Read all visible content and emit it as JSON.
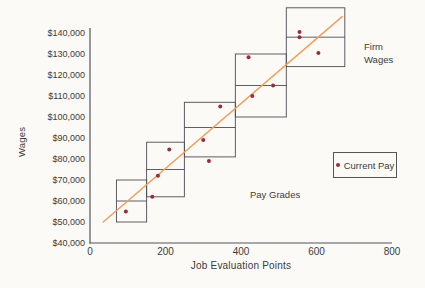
{
  "figure": {
    "y_axis_title": "Wages",
    "x_axis_title": "Job Evaluation Points",
    "annotation_firm_wages": "Firm Wages",
    "annotation_pay_grades": "Pay Grades",
    "legend_label": "Current Pay"
  },
  "colors": {
    "background": "#fbfaf6",
    "axis": "#55555a",
    "grade_box_border": "#4c4c55",
    "trend_line": "#efa05c",
    "data_point": "#992c3a",
    "text": "#3b3b3b"
  },
  "chart_data": {
    "type": "scatter",
    "title": "",
    "xlabel": "Job Evaluation Points",
    "ylabel": "Wages",
    "xlim": [
      0,
      800
    ],
    "ylim": [
      40000,
      140000
    ],
    "grid": false,
    "legend_position": "right-middle",
    "x_tick_values": [
      0,
      200,
      400,
      600,
      800
    ],
    "x_tick_labels": [
      "0",
      "200",
      "400",
      "600",
      "800"
    ],
    "y_tick_values": [
      40000,
      50000,
      60000,
      70000,
      80000,
      90000,
      100000,
      110000,
      120000,
      130000,
      140000
    ],
    "y_tick_labels": [
      "$40,000",
      "$50,000",
      "$60,000",
      "$70,000",
      "$80,000",
      "$90,000",
      "$100,000",
      "$110,000",
      "$120,000",
      "$130,000",
      "$140,000"
    ],
    "series": [
      {
        "name": "Current Pay",
        "type": "scatter",
        "points": [
          [
            95,
            55000
          ],
          [
            165,
            62000
          ],
          [
            180,
            72000
          ],
          [
            210,
            84500
          ],
          [
            300,
            89000
          ],
          [
            315,
            79000
          ],
          [
            345,
            105000
          ],
          [
            420,
            128500
          ],
          [
            430,
            110000
          ],
          [
            485,
            115000
          ],
          [
            555,
            138000
          ],
          [
            555,
            140500
          ],
          [
            605,
            130500
          ]
        ]
      }
    ],
    "trend_line": {
      "name": "pay-policy-line",
      "x": [
        35,
        668
      ],
      "y": [
        50000,
        147800
      ]
    },
    "pay_grades": [
      {
        "grade": 1,
        "x_min": 70,
        "x_max": 150,
        "pay_min": 50000,
        "pay_mid": 60000,
        "pay_max": 70000
      },
      {
        "grade": 2,
        "x_min": 150,
        "x_max": 250,
        "pay_min": 62000,
        "pay_mid": 75000,
        "pay_max": 88000
      },
      {
        "grade": 3,
        "x_min": 250,
        "x_max": 385,
        "pay_min": 81000,
        "pay_mid": 95000,
        "pay_max": 107000
      },
      {
        "grade": 4,
        "x_min": 385,
        "x_max": 520,
        "pay_min": 100000,
        "pay_mid": 115000,
        "pay_max": 130000
      },
      {
        "grade": 5,
        "x_min": 520,
        "x_max": 675,
        "pay_min": 124000,
        "pay_mid": 138000,
        "pay_max": 152000
      }
    ],
    "annotations": [
      {
        "text": "Firm Wages",
        "position": "upper-right"
      },
      {
        "text": "Pay Grades",
        "position": "lower-middle"
      }
    ]
  }
}
